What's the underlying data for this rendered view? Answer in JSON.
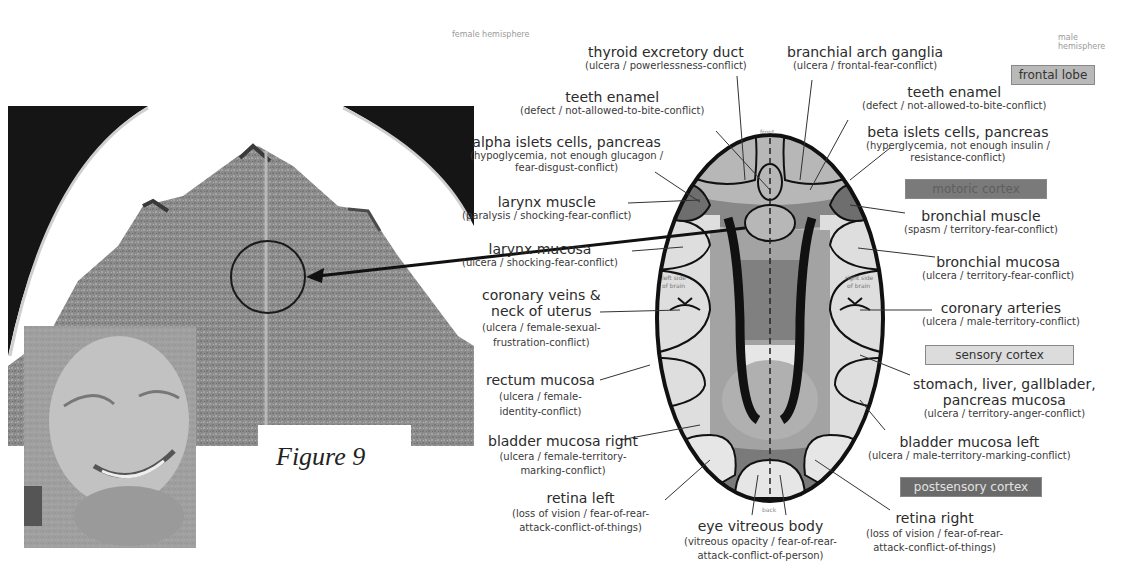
{
  "hemispheres": {
    "female": "female hemisphere",
    "male": "male hemisphere"
  },
  "figure": {
    "caption": "Figure 9"
  },
  "diagram": {
    "orientation": {
      "front": "front",
      "back": "back"
    },
    "sides": {
      "left": "left side of brain",
      "right": "right side of brain"
    }
  },
  "legend": [
    {
      "label": "frontal lobe",
      "color": "#b9b9b9",
      "text_color": "#333333"
    },
    {
      "label": "motoric cortex",
      "color": "#7a7a7a",
      "text_color": "#5e5e5e"
    },
    {
      "label": "sensory cortex",
      "color": "#dcdcdc",
      "text_color": "#333333"
    },
    {
      "label": "postsensory cortex",
      "color": "#6a6a6a",
      "text_color": "#e2e2e2"
    }
  ],
  "labels": {
    "thyroid": {
      "title": "thyroid excretory duct",
      "sub": [
        "(ulcera / powerlessness-conflict)"
      ]
    },
    "branchial_arch": {
      "title": "branchial arch ganglia",
      "sub": [
        "(ulcera / frontal-fear-conflict)"
      ]
    },
    "teeth_left": {
      "title": "teeth enamel",
      "sub": [
        "(defect / not-allowed-to-bite-conflict)"
      ]
    },
    "teeth_right": {
      "title": "teeth enamel",
      "sub": [
        "(defect / not-allowed-to-bite-conflict)"
      ]
    },
    "alpha_islets": {
      "title": "alpha islets cells, pancreas",
      "sub": [
        "(hypoglycemia, not enough glucagon /",
        "fear-disgust-conflict)"
      ]
    },
    "beta_islets": {
      "title": "beta islets cells, pancreas",
      "sub": [
        "(hyperglycemia, not enough insulin /",
        "resistance-conflict)"
      ]
    },
    "larynx_muscle": {
      "title": "larynx muscle",
      "sub": [
        "(paralysis / shocking-fear-conflict)"
      ]
    },
    "bronchial_muscle": {
      "title": "bronchial muscle",
      "sub": [
        "(spasm / territory-fear-conflict)"
      ]
    },
    "larynx_mucosa": {
      "title": "larynx mucosa",
      "sub": [
        "(ulcera / shocking-fear-conflict)"
      ]
    },
    "bronchial_mucosa": {
      "title": "bronchial mucosa",
      "sub": [
        "(ulcera / territory-fear-conflict)"
      ]
    },
    "coronary_veins": {
      "title": [
        "coronary veins &",
        "neck of uterus"
      ],
      "sub": [
        "(ulcera / female-sexual-",
        "frustration-conflict)"
      ]
    },
    "coronary_arteries": {
      "title": "coronary arteries",
      "sub": [
        "(ulcera / male-territory-conflict)"
      ]
    },
    "rectum_mucosa": {
      "title": "rectum mucosa",
      "sub": [
        "(ulcera / female-",
        "identity-conflict)"
      ]
    },
    "stomach": {
      "title": [
        "stomach, liver, gallblader,",
        "pancreas mucosa"
      ],
      "sub": [
        "(ulcera / territory-anger-conflict)"
      ]
    },
    "bladder_right": {
      "title": "bladder mucosa right",
      "sub": [
        "(ulcera / female-territory-",
        "marking-conflict)"
      ]
    },
    "bladder_left": {
      "title": "bladder mucosa left",
      "sub": [
        "(ulcera / male-territory-marking-conflict)"
      ]
    },
    "retina_left": {
      "title": "retina left",
      "sub": [
        "(loss of vision / fear-of-rear-",
        "attack-conflict-of-things)"
      ]
    },
    "retina_right": {
      "title": "retina right",
      "sub": [
        "(loss of vision / fear-of-rear-",
        "attack-conflict-of-things)"
      ]
    },
    "vitreous": {
      "title": "eye vitreous body",
      "sub": [
        "(vitreous opacity / fear-of-rear-",
        "attack-conflict-of-person)"
      ]
    }
  },
  "images": {
    "ct_scan": "brain CT scan (axial, with circled lesion)",
    "portrait": "portrait photo of smiling man"
  }
}
